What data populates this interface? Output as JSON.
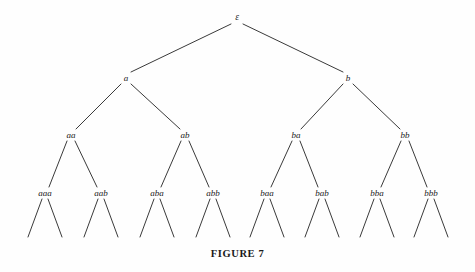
{
  "figure": {
    "caption": "FIGURE 7",
    "caption_x": 237,
    "caption_y": 248,
    "background_color": "#fefefe",
    "edge_color": "#3a3a3a",
    "text_color": "#1a1a1a",
    "width": 475,
    "height": 272
  },
  "tree": {
    "description": "Complete binary tree of strings over the alphabet {a, b}, rooted at the empty string epsilon, drawn to depth three with unlabeled depth-four leaf edges.",
    "alphabet": [
      "a",
      "b"
    ],
    "depth_labeled": 3,
    "nodes": [
      {
        "id": "root",
        "label": "ε",
        "level": 0,
        "x": 237,
        "y": 18
      },
      {
        "id": "a",
        "label": "a",
        "level": 1,
        "x": 126,
        "y": 78
      },
      {
        "id": "b",
        "label": "b",
        "level": 1,
        "x": 348,
        "y": 78
      },
      {
        "id": "aa",
        "label": "aa",
        "level": 2,
        "x": 71,
        "y": 135
      },
      {
        "id": "ab",
        "label": "ab",
        "level": 2,
        "x": 185,
        "y": 135
      },
      {
        "id": "ba",
        "label": "ba",
        "level": 2,
        "x": 296,
        "y": 135
      },
      {
        "id": "bb",
        "label": "bb",
        "level": 2,
        "x": 405,
        "y": 135
      },
      {
        "id": "aaa",
        "label": "aaa",
        "level": 3,
        "x": 45,
        "y": 193
      },
      {
        "id": "aab",
        "label": "aab",
        "level": 3,
        "x": 101,
        "y": 193
      },
      {
        "id": "aba",
        "label": "aba",
        "level": 3,
        "x": 157,
        "y": 193
      },
      {
        "id": "abb",
        "label": "abb",
        "level": 3,
        "x": 213,
        "y": 193
      },
      {
        "id": "baa",
        "label": "baa",
        "level": 3,
        "x": 267,
        "y": 193
      },
      {
        "id": "bab",
        "label": "bab",
        "level": 3,
        "x": 322,
        "y": 193
      },
      {
        "id": "bba",
        "label": "bba",
        "level": 3,
        "x": 377,
        "y": 193
      },
      {
        "id": "bbb",
        "label": "bbb",
        "level": 3,
        "x": 431,
        "y": 193
      }
    ],
    "edges": [
      {
        "from": "root",
        "to": "a",
        "x1": 231,
        "y1": 24,
        "x2": 131,
        "y2": 72
      },
      {
        "from": "root",
        "to": "b",
        "x1": 243,
        "y1": 24,
        "x2": 343,
        "y2": 72
      },
      {
        "from": "a",
        "to": "aa",
        "x1": 121,
        "y1": 84,
        "x2": 76,
        "y2": 129
      },
      {
        "from": "a",
        "to": "ab",
        "x1": 131,
        "y1": 84,
        "x2": 180,
        "y2": 129
      },
      {
        "from": "b",
        "to": "ba",
        "x1": 343,
        "y1": 84,
        "x2": 301,
        "y2": 129
      },
      {
        "from": "b",
        "to": "bb",
        "x1": 353,
        "y1": 84,
        "x2": 400,
        "y2": 129
      },
      {
        "from": "aa",
        "to": "aaa",
        "x1": 67,
        "y1": 141,
        "x2": 49,
        "y2": 187
      },
      {
        "from": "aa",
        "to": "aab",
        "x1": 75,
        "y1": 141,
        "x2": 97,
        "y2": 187
      },
      {
        "from": "ab",
        "to": "aba",
        "x1": 181,
        "y1": 141,
        "x2": 161,
        "y2": 187
      },
      {
        "from": "ab",
        "to": "abb",
        "x1": 189,
        "y1": 141,
        "x2": 209,
        "y2": 187
      },
      {
        "from": "ba",
        "to": "baa",
        "x1": 292,
        "y1": 141,
        "x2": 271,
        "y2": 187
      },
      {
        "from": "ba",
        "to": "bab",
        "x1": 300,
        "y1": 141,
        "x2": 318,
        "y2": 187
      },
      {
        "from": "bb",
        "to": "bba",
        "x1": 401,
        "y1": 141,
        "x2": 381,
        "y2": 187
      },
      {
        "from": "bb",
        "to": "bbb",
        "x1": 409,
        "y1": 141,
        "x2": 427,
        "y2": 187
      }
    ],
    "leaf_edges": [
      {
        "parent": "aaa",
        "x1": 42,
        "y1": 199,
        "x2": 28,
        "y2": 237
      },
      {
        "parent": "aaa",
        "x1": 48,
        "y1": 199,
        "x2": 62,
        "y2": 237
      },
      {
        "parent": "aab",
        "x1": 98,
        "y1": 199,
        "x2": 84,
        "y2": 237
      },
      {
        "parent": "aab",
        "x1": 104,
        "y1": 199,
        "x2": 118,
        "y2": 237
      },
      {
        "parent": "aba",
        "x1": 154,
        "y1": 199,
        "x2": 140,
        "y2": 237
      },
      {
        "parent": "aba",
        "x1": 160,
        "y1": 199,
        "x2": 174,
        "y2": 237
      },
      {
        "parent": "abb",
        "x1": 210,
        "y1": 199,
        "x2": 196,
        "y2": 237
      },
      {
        "parent": "abb",
        "x1": 216,
        "y1": 199,
        "x2": 230,
        "y2": 237
      },
      {
        "parent": "baa",
        "x1": 264,
        "y1": 199,
        "x2": 250,
        "y2": 237
      },
      {
        "parent": "baa",
        "x1": 270,
        "y1": 199,
        "x2": 284,
        "y2": 237
      },
      {
        "parent": "bab",
        "x1": 319,
        "y1": 199,
        "x2": 305,
        "y2": 237
      },
      {
        "parent": "bab",
        "x1": 325,
        "y1": 199,
        "x2": 339,
        "y2": 237
      },
      {
        "parent": "bba",
        "x1": 374,
        "y1": 199,
        "x2": 360,
        "y2": 237
      },
      {
        "parent": "bba",
        "x1": 380,
        "y1": 199,
        "x2": 394,
        "y2": 237
      },
      {
        "parent": "bbb",
        "x1": 428,
        "y1": 199,
        "x2": 414,
        "y2": 237
      },
      {
        "parent": "bbb",
        "x1": 434,
        "y1": 199,
        "x2": 448,
        "y2": 237
      }
    ]
  }
}
